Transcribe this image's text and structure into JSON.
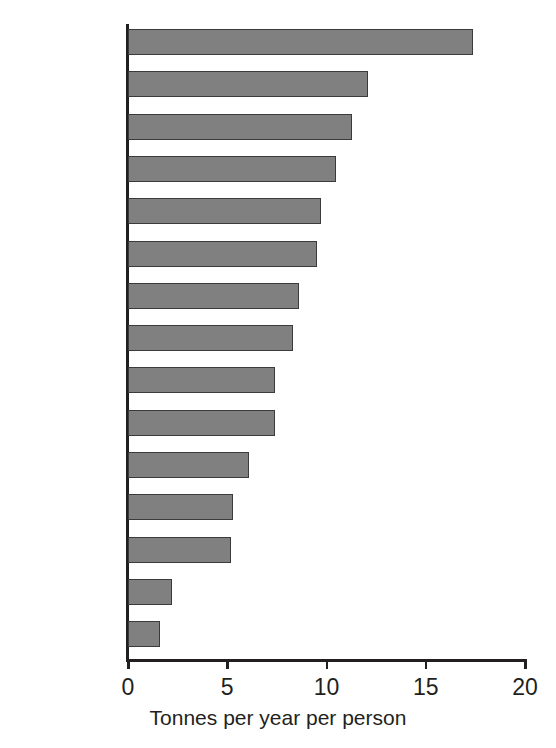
{
  "chart_data": {
    "type": "bar",
    "orientation": "horizontal",
    "title": "",
    "xlabel": "Tonnes per year per person",
    "ylabel": "",
    "xlim": [
      0,
      20
    ],
    "xticks": [
      0,
      5,
      10,
      15,
      20
    ],
    "xtick_labels": [
      "0",
      "5",
      "10",
      "15",
      "20"
    ],
    "grid": false,
    "legend": null,
    "bar_color": "#808080",
    "bar_edge_color": "#3b3b3b",
    "axis_color": "#231f20",
    "categories": [
      "US",
      "Russia",
      "Czech Rep.",
      "Netherlands",
      "Germany",
      "Japan",
      "UK",
      "Poland",
      "Italy",
      "Spain",
      "France",
      "Sweden",
      "China",
      "Brazil",
      "India"
    ],
    "values": [
      17.4,
      12.1,
      11.3,
      10.5,
      9.7,
      9.5,
      8.6,
      8.3,
      7.4,
      7.4,
      6.1,
      5.3,
      5.2,
      2.2,
      1.6
    ]
  },
  "axis": {
    "x_label": "Tonnes per year per person"
  },
  "title_sliver": ""
}
